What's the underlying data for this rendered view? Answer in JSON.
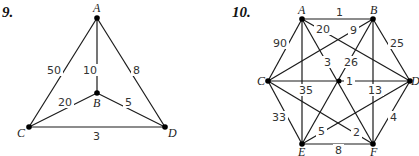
{
  "graphs": [
    {
      "number": "9.",
      "nodes": [
        {
          "id": "A",
          "label": "A",
          "x": 97,
          "y": 18,
          "lx": 93,
          "ly": 12
        },
        {
          "id": "B",
          "label": "B",
          "x": 97,
          "y": 93,
          "lx": 93,
          "ly": 107
        },
        {
          "id": "C",
          "label": "C",
          "x": 29,
          "y": 127,
          "lx": 17,
          "ly": 137
        },
        {
          "id": "D",
          "label": "D",
          "x": 165,
          "y": 127,
          "lx": 168,
          "ly": 137
        }
      ],
      "edges": [
        {
          "from": "A",
          "to": "C",
          "weight": "50",
          "wx": 47,
          "wy": 74
        },
        {
          "from": "A",
          "to": "B",
          "weight": "10",
          "wx": 83,
          "wy": 74
        },
        {
          "from": "A",
          "to": "D",
          "weight": "8",
          "wx": 133,
          "wy": 74
        },
        {
          "from": "B",
          "to": "C",
          "weight": "20",
          "wx": 58,
          "wy": 106
        },
        {
          "from": "B",
          "to": "D",
          "weight": "5",
          "wx": 125,
          "wy": 106
        },
        {
          "from": "C",
          "to": "D",
          "weight": "3",
          "wx": 93,
          "wy": 140
        }
      ]
    },
    {
      "number": "10.",
      "nodes": [
        {
          "id": "A",
          "label": "A",
          "x": 302,
          "y": 19,
          "lx": 298,
          "ly": 14
        },
        {
          "id": "B",
          "label": "B",
          "x": 373,
          "y": 19,
          "lx": 370,
          "ly": 14
        },
        {
          "id": "C",
          "label": "C",
          "x": 268,
          "y": 81,
          "lx": 257,
          "ly": 85
        },
        {
          "id": "D",
          "label": "D",
          "x": 410,
          "y": 81,
          "lx": 411,
          "ly": 85
        },
        {
          "id": "E",
          "label": "E",
          "x": 302,
          "y": 144,
          "lx": 298,
          "ly": 156
        },
        {
          "id": "F",
          "label": "F",
          "x": 373,
          "y": 144,
          "lx": 370,
          "ly": 156
        }
      ],
      "edges": [
        {
          "from": "A",
          "to": "B",
          "weight": "1",
          "wx": 336,
          "wy": 16
        },
        {
          "from": "A",
          "to": "C",
          "weight": "90",
          "wx": 273,
          "wy": 47
        },
        {
          "from": "A",
          "to": "D",
          "weight": "20",
          "wx": 316,
          "wy": 33
        },
        {
          "from": "A",
          "to": "E",
          "weight": "35",
          "wx": 299,
          "wy": 94
        },
        {
          "from": "A",
          "to": "F",
          "weight": "3",
          "wx": 324,
          "wy": 66
        },
        {
          "from": "B",
          "to": "C",
          "weight": "9",
          "wx": 350,
          "wy": 34
        },
        {
          "from": "B",
          "to": "D",
          "weight": "25",
          "wx": 390,
          "wy": 47
        },
        {
          "from": "B",
          "to": "E",
          "weight": "26",
          "wx": 344,
          "wy": 66
        },
        {
          "from": "B",
          "to": "F",
          "weight": "13",
          "wx": 368,
          "wy": 94
        },
        {
          "from": "C",
          "to": "D",
          "weight": "1",
          "wx": 346,
          "wy": 85
        },
        {
          "from": "C",
          "to": "E",
          "weight": "33",
          "wx": 272,
          "wy": 121
        },
        {
          "from": "C",
          "to": "F",
          "weight": "2",
          "wx": 353,
          "wy": 136
        },
        {
          "from": "D",
          "to": "E",
          "weight": "5",
          "wx": 318,
          "wy": 135
        },
        {
          "from": "D",
          "to": "F",
          "weight": "4",
          "wx": 390,
          "wy": 121
        },
        {
          "from": "E",
          "to": "F",
          "weight": "8",
          "wx": 335,
          "wy": 154
        }
      ]
    }
  ]
}
